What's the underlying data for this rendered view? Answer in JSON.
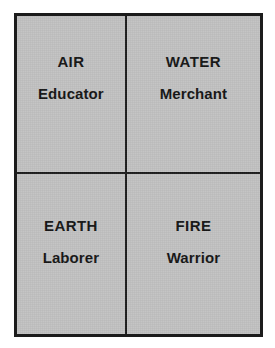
{
  "figure": {
    "background_color": "#ffffff",
    "fill_color": "#c2c2c2",
    "border_color": "#1c1c1c",
    "text_color": "#141414"
  },
  "chart_data": {
    "type": "table",
    "title": "",
    "xlabel": "",
    "ylabel": "",
    "grid": true,
    "legend": "none",
    "rows": 2,
    "columns": 2,
    "cells": [
      {
        "position": "top-left",
        "element": "AIR",
        "role": "Educator"
      },
      {
        "position": "top-right",
        "element": "WATER",
        "role": "Merchant"
      },
      {
        "position": "bottom-left",
        "element": "EARTH",
        "role": "Laborer"
      },
      {
        "position": "bottom-right",
        "element": "FIRE",
        "role": "Warrior"
      }
    ]
  },
  "quadrants": {
    "top_left": {
      "element": "AIR",
      "role": "Educator"
    },
    "top_right": {
      "element": "WATER",
      "role": "Merchant"
    },
    "bottom_left": {
      "element": "EARTH",
      "role": "Laborer"
    },
    "bottom_right": {
      "element": "FIRE",
      "role": "Warrior"
    }
  }
}
